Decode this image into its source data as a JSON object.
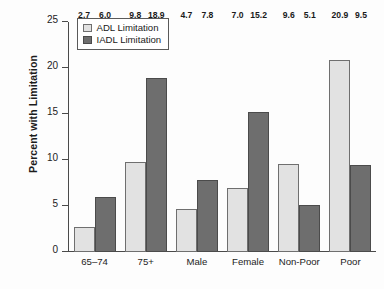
{
  "chart_data": {
    "type": "bar",
    "title": "",
    "xlabel": "",
    "ylabel": "Percent with Limitation",
    "ylim": [
      0,
      25
    ],
    "yticks": [
      0,
      5,
      10,
      15,
      20,
      25
    ],
    "ytick_labels": [
      "0",
      "5",
      "10",
      "15",
      "20",
      "25"
    ],
    "grid": false,
    "legend_position": "top-left-inside",
    "categories": [
      "65–74",
      "75+",
      "Male",
      "Female",
      "Non-Poor",
      "Poor"
    ],
    "series": [
      {
        "name": "ADL Limitation",
        "color": "#e2e2e2",
        "edge_color": "#6f6f6f",
        "values": [
          2.7,
          9.8,
          4.7,
          7.0,
          9.6,
          20.9
        ],
        "labels": [
          "2.7",
          "9.8",
          "4.7",
          "7.0",
          "9.6",
          "20.9"
        ]
      },
      {
        "name": "IADL Limitation",
        "color": "#6e6e6e",
        "edge_color": "#4b4b4b",
        "values": [
          6.0,
          18.9,
          7.8,
          15.2,
          5.1,
          9.5
        ],
        "labels": [
          "6.0",
          "18.9",
          "7.8",
          "15.2",
          "5.1",
          "9.5"
        ]
      }
    ]
  },
  "legend": {
    "items": [
      {
        "label": "ADL Limitation"
      },
      {
        "label": "IADL Limitation"
      }
    ]
  },
  "colors": {
    "adl_fill": "#e2e2e2",
    "iadl_fill": "#6e6e6e",
    "axis": "#4a4a4a",
    "text": "#1a1a1a",
    "background": "#fdfdfd"
  }
}
